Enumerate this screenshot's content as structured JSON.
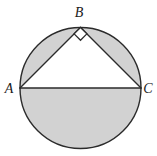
{
  "figure": {
    "title": "Right triangle inscribed in a circle",
    "background_color": "#ffffff",
    "stroke_color": "#2b2b2b",
    "shade_color": "#d2d2d2",
    "triangle_fill": "#ffffff",
    "stroke_width": 1.4,
    "circle": {
      "center_x": 80.5,
      "center_y": 88,
      "radius": 60.5
    },
    "points": {
      "A": {
        "x": 20,
        "y": 88,
        "label": "A",
        "label_x": 9,
        "label_y": 93
      },
      "B": {
        "x": 80.5,
        "y": 27.5,
        "label": "B",
        "label_x": 76,
        "label_y": 17
      },
      "C": {
        "x": 141,
        "y": 88,
        "label": "C",
        "label_x": 144,
        "label_y": 93
      }
    },
    "right_angle_marker": {
      "at_vertex": "B",
      "size": 9,
      "stroke_color": "#2b2b2b",
      "fill": "#ffffff"
    },
    "shaded_regions": [
      {
        "name": "left-segment",
        "description": "segment between chord AB and arc AB"
      },
      {
        "name": "right-segment",
        "description": "segment between chord BC and arc BC"
      },
      {
        "name": "lower-semicircle",
        "description": "half-disc below diameter AC"
      }
    ],
    "segments": [
      {
        "name": "side-ab",
        "from": "A",
        "to": "B"
      },
      {
        "name": "side-bc",
        "from": "B",
        "to": "C"
      },
      {
        "name": "side-ac",
        "from": "A",
        "to": "C"
      }
    ]
  }
}
